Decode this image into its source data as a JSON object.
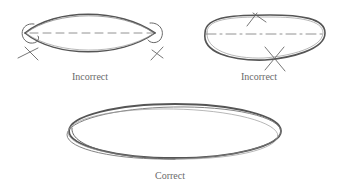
{
  "figure": {
    "panels": [
      {
        "id": "left",
        "label": "Incorrect",
        "description": "Pointed lens-shaped ellipse with circled pointed ends and X marks at each end"
      },
      {
        "id": "right",
        "label": "Incorrect",
        "description": "Flattened ellipse with X marks at top and bottom of the curve"
      },
      {
        "id": "bottom",
        "label": "Correct",
        "description": "Smooth sketched ellipse drawn with multiple overlapping strokes"
      }
    ],
    "colors": {
      "stroke": "#555555",
      "stroke_light": "#8a8a8a",
      "label": "#6a6a6a",
      "background": "#ffffff"
    }
  }
}
